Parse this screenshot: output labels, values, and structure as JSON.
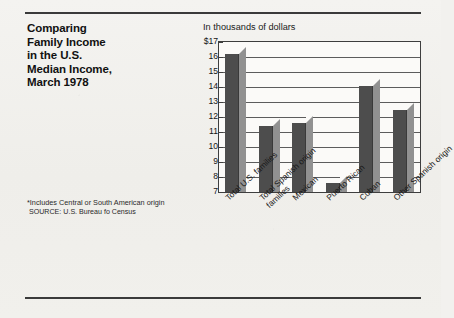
{
  "title_lines": [
    "Comparing",
    "Family Income",
    "in the U.S.",
    "Median Income,",
    "March 1978"
  ],
  "unit_label": "In thousands of dollars",
  "footnote": {
    "line1": "*Includes Central or South American origin",
    "source_prefix": "SOURCE:",
    "source_rest": " U.S. Bureau fo Census"
  },
  "chart_data": {
    "type": "bar",
    "subtitle": "In thousands of dollars",
    "xlabel": "",
    "ylabel": "In thousands of dollars",
    "ylim": [
      7,
      17
    ],
    "grid": true,
    "legend": "none",
    "categories": [
      "Total U.S. families",
      "Total Spanish origin families",
      "Mexican",
      "Puerto Rican",
      "Cuban",
      "Other Spanish origin"
    ],
    "category_lines": [
      [
        "Total U.S. families",
        ""
      ],
      [
        "Total Spanish origin",
        "families"
      ],
      [
        "Mexican",
        ""
      ],
      [
        "Puerto Rican",
        ""
      ],
      [
        "Cuban",
        ""
      ],
      [
        "Other Spanish origin",
        ""
      ]
    ],
    "values": [
      16.2,
      11.4,
      11.6,
      7.6,
      14.1,
      12.5
    ],
    "ytick_labels": [
      "$17",
      "16",
      "15",
      "14",
      "13",
      "12",
      "11",
      "10",
      "9",
      "8",
      "7"
    ],
    "ytick_values": [
      17,
      16,
      15,
      14,
      13,
      12,
      11,
      10,
      9,
      8,
      7
    ],
    "colors": {
      "bar_front": "#4d4d4d",
      "bar_side": "#919191",
      "plot_bg": "#fbfaf8",
      "gridline": "#5c5c5c",
      "axis": "#3e3e3e",
      "page_bg": "#f2f1ee",
      "rule": "#3a3a3a"
    }
  }
}
